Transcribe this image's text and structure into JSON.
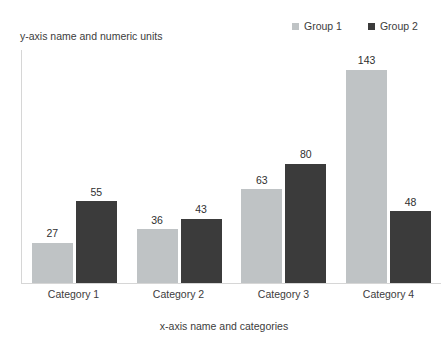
{
  "chart_data": {
    "type": "bar",
    "title": "",
    "subtitle": "",
    "xlabel": "x-axis name and categories",
    "ylabel": "y-axis name and numeric units",
    "categories": [
      "Category 1",
      "Category 2",
      "Category 3",
      "Category 4"
    ],
    "series": [
      {
        "name": "Group 1",
        "color": "#bfc3c5",
        "values": [
          27,
          36,
          63,
          143
        ]
      },
      {
        "name": "Group 2",
        "color": "#3b3b3b",
        "values": [
          55,
          43,
          80,
          48
        ]
      }
    ],
    "ylim": [
      0,
      157
    ],
    "grid": false,
    "data_labels": true,
    "legend_position": "top-right",
    "axis_color": "#d6d6d6"
  },
  "legend": {
    "items": [
      {
        "label": "Group 1",
        "swatch": "#bfc3c5"
      },
      {
        "label": "Group 2",
        "swatch": "#3b3b3b"
      }
    ]
  },
  "axes": {
    "y_title": "y-axis name and numeric units",
    "x_title": "x-axis name and categories"
  }
}
